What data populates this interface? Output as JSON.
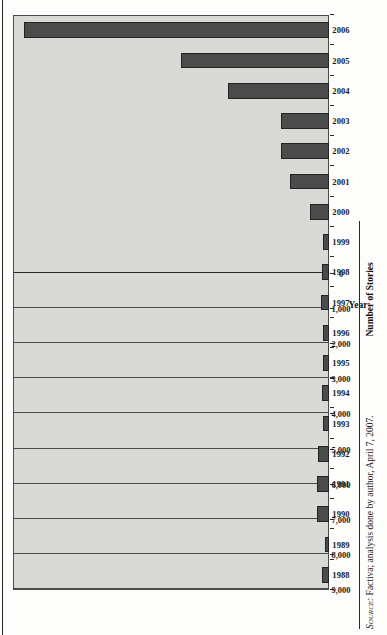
{
  "figure": {
    "source_note_prefix": "Source:",
    "source_note": " Factiva; analysis done by author, April 7, 2007."
  },
  "chart_data": {
    "type": "bar",
    "title": "",
    "xlabel": "Year",
    "ylabel": "Number of Stories",
    "orientation": "vertical-rotated-90ccw",
    "grid": true,
    "legend": "none",
    "ylim": [
      0,
      9000
    ],
    "ytick_labels": [
      "0",
      "1,000",
      "2,000",
      "3,000",
      "4,000",
      "5,000",
      "6,000",
      "7,000",
      "8,000",
      "9,000"
    ],
    "ytick_values": [
      0,
      1000,
      2000,
      3000,
      4000,
      5000,
      6000,
      7000,
      8000,
      9000
    ],
    "categories": [
      "1988",
      "1989",
      "1990",
      "1991",
      "1992",
      "1993",
      "1994",
      "1995",
      "1996",
      "1997",
      "1998",
      "1999",
      "2000",
      "2001",
      "2002",
      "2003",
      "2004",
      "2005",
      "2006"
    ],
    "values": [
      200,
      120,
      330,
      340,
      310,
      180,
      200,
      170,
      180,
      220,
      200,
      160,
      540,
      1120,
      1380,
      1380,
      2880,
      4220,
      8700
    ],
    "bar_color": "#4b4b4b",
    "plot_background": "#d9d9d6"
  }
}
